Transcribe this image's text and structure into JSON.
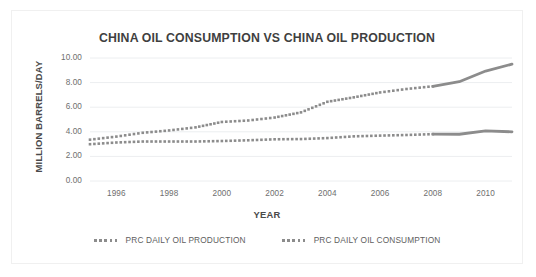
{
  "chart_data": {
    "type": "line",
    "title": "CHINA OIL CONSUMPTION VS CHINA OIL PRODUCTION",
    "xlabel": "YEAR",
    "ylabel": "MILLION BARRELS/DAY",
    "xlim": [
      1995,
      2011
    ],
    "ylim": [
      0,
      10
    ],
    "grid": true,
    "legend_position": "bottom",
    "x": [
      1995,
      1996,
      1997,
      1998,
      1999,
      2000,
      2001,
      2002,
      2003,
      2004,
      2005,
      2006,
      2007,
      2008,
      2009,
      2010,
      2011
    ],
    "xticks": [
      "1996",
      "1998",
      "2000",
      "2002",
      "2004",
      "2006",
      "2008",
      "2010"
    ],
    "xtick_values": [
      1996,
      1998,
      2000,
      2002,
      2004,
      2006,
      2008,
      2010
    ],
    "yticks": [
      "0.00",
      "2.00",
      "4.00",
      "6.00",
      "8.00",
      "10.00"
    ],
    "ytick_values": [
      0,
      2,
      4,
      6,
      8,
      10
    ],
    "series": [
      {
        "name": "PRC DAILY OIL PRODUCTION",
        "color": "#8c8c8c",
        "style": "dotted",
        "values": [
          2.99,
          3.13,
          3.21,
          3.21,
          3.21,
          3.25,
          3.31,
          3.39,
          3.41,
          3.49,
          3.63,
          3.69,
          3.74,
          3.81,
          3.8,
          4.08,
          4.0
        ]
      },
      {
        "name": "PRC DAILY OIL CONSUMPTION",
        "color": "#8c8c8c",
        "style": "dotted",
        "values": [
          3.36,
          3.61,
          3.92,
          4.11,
          4.36,
          4.8,
          4.92,
          5.16,
          5.58,
          6.44,
          6.8,
          7.2,
          7.48,
          7.7,
          8.07,
          8.94,
          9.5
        ]
      }
    ]
  },
  "legend": {
    "items": [
      {
        "label": "PRC DAILY OIL PRODUCTION",
        "marker": "dotted-line-marker"
      },
      {
        "label": "PRC DAILY OIL CONSUMPTION",
        "marker": "dotted-line-marker"
      }
    ]
  },
  "colors": {
    "series_gray": "#8c8c8c",
    "gridline": "#eceef0",
    "tick_text": "#6e6e6e",
    "title_text": "#3f3f3f",
    "frame_border": "#f0f0f0"
  }
}
